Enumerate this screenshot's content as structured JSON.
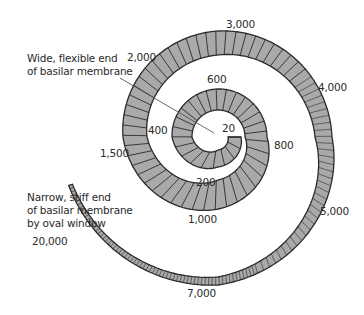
{
  "figure": {
    "annotations": {
      "wide_end": [
        "Wide, flexible end",
        "of basilar membrane"
      ],
      "narrow_end": [
        "Narrow, stiff end",
        "of basilar membrane",
        "by oval window"
      ]
    },
    "frequency_labels": [
      {
        "text": "20",
        "x": 222,
        "y": 122
      },
      {
        "text": "200",
        "x": 196,
        "y": 176
      },
      {
        "text": "400",
        "x": 148,
        "y": 124
      },
      {
        "text": "600",
        "x": 207,
        "y": 73
      },
      {
        "text": "800",
        "x": 274,
        "y": 139
      },
      {
        "text": "1,000",
        "x": 188,
        "y": 213
      },
      {
        "text": "1,500",
        "x": 100,
        "y": 147
      },
      {
        "text": "2,000",
        "x": 127,
        "y": 51
      },
      {
        "text": "3,000",
        "x": 226,
        "y": 18
      },
      {
        "text": "4,000",
        "x": 318,
        "y": 81
      },
      {
        "text": "5,000",
        "x": 320,
        "y": 205
      },
      {
        "text": "7,000",
        "x": 187,
        "y": 287
      },
      {
        "text": "20,000",
        "x": 32,
        "y": 235
      }
    ],
    "colors": {
      "band_fill": "#a9a9a9",
      "band_stroke": "#2b2b2b",
      "pointer": "#555555",
      "text": "#2a2a2a"
    }
  }
}
